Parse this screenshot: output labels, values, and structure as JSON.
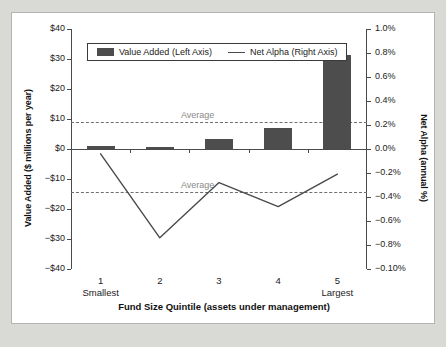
{
  "chart_data": {
    "type": "bar",
    "title": "",
    "subtitle": "",
    "xlabel": "Fund Size Quintile (assets under management)",
    "ylabel": "Value Added ($ millions per year)",
    "y2label": "Net Alpha (annual %)",
    "grid": false,
    "legend_position": "top-center",
    "categories": [
      "1",
      "2",
      "3",
      "4",
      "5"
    ],
    "category_subnotes": [
      "Smallest",
      "",
      "",
      "",
      "Largest"
    ],
    "ylim": [
      -40,
      40
    ],
    "y2lim": [
      -1.0,
      1.0
    ],
    "ytick_labels": [
      "$40",
      "$30",
      "$20",
      "$10",
      "$0",
      "−$10",
      "−$20",
      "−$30",
      "−$40"
    ],
    "ytick_values": [
      40,
      30,
      20,
      10,
      0,
      -10,
      -20,
      -30,
      -40
    ],
    "y2tick_labels": [
      "1.0%",
      "0.8%",
      "0.6%",
      "0.4%",
      "0.2%",
      "0.0%",
      "−0.2%",
      "−0.4%",
      "−0.6%",
      "−0.8%",
      "−0.10%"
    ],
    "y2tick_values": [
      1.0,
      0.8,
      0.6,
      0.4,
      0.2,
      0.0,
      -0.2,
      -0.4,
      -0.6,
      -0.8,
      -1.0
    ],
    "series": [
      {
        "name": "Value Added (Left Axis)",
        "type": "bar",
        "axis": "left",
        "color": "#4d4d4d",
        "values": [
          1.0,
          0.8,
          3.5,
          7.0,
          31.2
        ]
      },
      {
        "name": "Net Alpha (Right Axis)",
        "type": "line",
        "axis": "right",
        "color": "#4a4a4a",
        "values": [
          -0.04,
          -0.74,
          -0.28,
          -0.48,
          -0.21
        ]
      }
    ],
    "annotations": [
      {
        "label": "Average",
        "axis": "left",
        "value": 9.0,
        "style": "dashed"
      },
      {
        "label": "Average",
        "axis": "right",
        "value": -0.355,
        "style": "dashed"
      }
    ]
  },
  "legend": {
    "items": [
      {
        "label": "Value Added (Left Axis)",
        "marker": "bar-swatch"
      },
      {
        "label": "Net Alpha (Right Axis)",
        "marker": "line-swatch"
      }
    ]
  }
}
